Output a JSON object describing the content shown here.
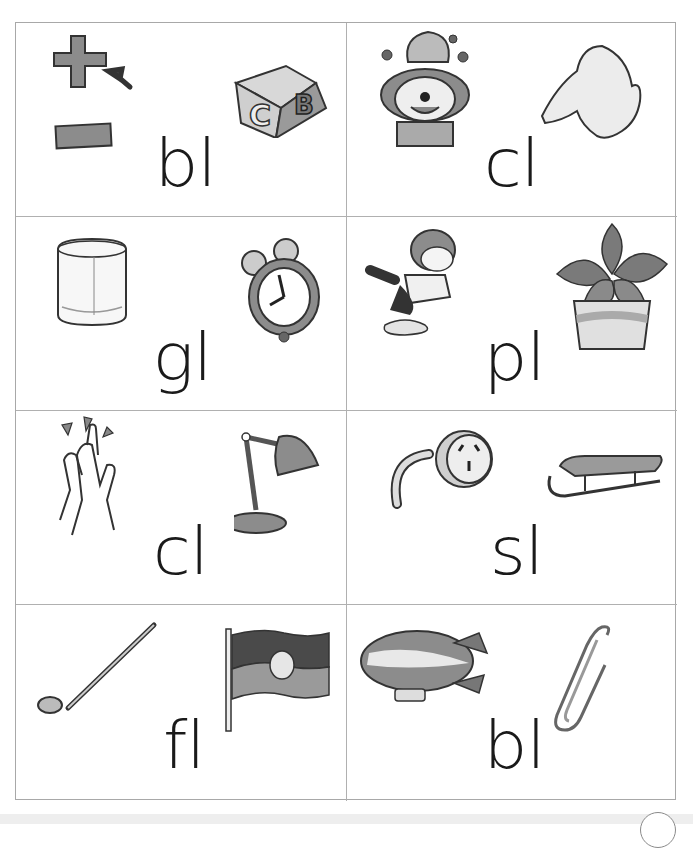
{
  "worksheet": {
    "topic": "l-blends flashcards",
    "cards": [
      {
        "blend": "bl",
        "pictures": [
          "plus-minus-signs",
          "alphabet-block"
        ]
      },
      {
        "blend": "cl",
        "pictures": [
          "clown",
          "claw-hand"
        ]
      },
      {
        "blend": "gl",
        "pictures": [
          "glass",
          "alarm-clock"
        ]
      },
      {
        "blend": "pl",
        "pictures": [
          "boy-splashing-puddle",
          "potted-plant"
        ]
      },
      {
        "blend": "cl",
        "pictures": [
          "clapping-hands",
          "desk-lamp"
        ]
      },
      {
        "blend": "sl",
        "pictures": [
          "power-plug",
          "sled"
        ]
      },
      {
        "blend": "fl",
        "pictures": [
          "golf-club",
          "flag"
        ]
      },
      {
        "blend": "bl",
        "pictures": [
          "blimp",
          "paper-clip"
        ]
      }
    ]
  },
  "colors": {
    "border": "#a8a8a8",
    "text": "#1a1a1a",
    "fill_gray": "#8c8c8c",
    "fill_light": "#e2e2e2"
  }
}
